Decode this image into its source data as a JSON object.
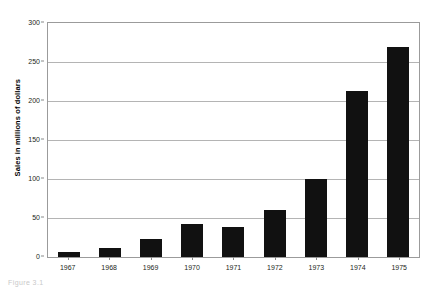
{
  "chart_data": {
    "type": "bar",
    "title": "",
    "xlabel": "",
    "ylabel": "Sales in millions of dollars",
    "categories": [
      "1967",
      "1968",
      "1969",
      "1970",
      "1971",
      "1972",
      "1973",
      "1974",
      "1975"
    ],
    "values": [
      7,
      11,
      23,
      42,
      39,
      60,
      100,
      213,
      269
    ],
    "ylim": [
      0,
      300
    ],
    "yticks": [
      0,
      50,
      100,
      150,
      200,
      250,
      300
    ],
    "ytick_labels": [
      "0",
      "50",
      "100",
      "150",
      "200",
      "250",
      "300"
    ],
    "grid": true,
    "grid_axis": "y",
    "legend": false,
    "bar_color": "#111111",
    "gridline_color": "#b4b4b4",
    "axis_color": "#9b9b9b"
  },
  "caption": {
    "remnant_text": "Figure 3.1"
  }
}
